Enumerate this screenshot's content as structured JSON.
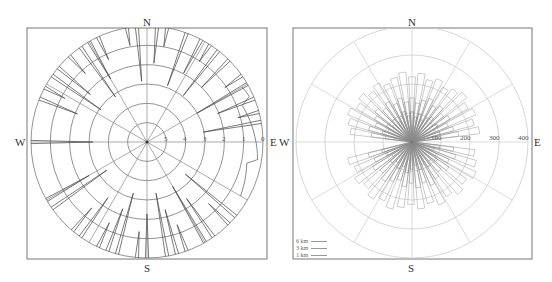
{
  "chart_data": [
    {
      "type": "polar-line",
      "title": "",
      "compass": {
        "north": "N",
        "south": "S",
        "east": "E",
        "west": "W"
      },
      "radial_tick_labels": [
        "5",
        "4",
        "3",
        "2",
        "1",
        "0"
      ],
      "rings": 6,
      "spoke_angle_step_deg": 30,
      "frame": {
        "x": 27,
        "y": 28,
        "w": 240,
        "h": 231
      },
      "center": [
        147,
        142
      ],
      "outer_radius": 116,
      "series": [
        {
          "name": "profile",
          "color": "#444444",
          "spikes_deg": [
            350,
            355,
            5,
            10,
            20,
            28,
            33,
            38,
            45,
            55,
            60,
            68,
            75,
            80,
            292,
            298,
            305,
            310,
            318,
            325,
            330,
            335,
            270,
            180,
            185,
            195,
            200,
            205,
            170,
            165,
            160,
            150,
            145,
            135,
            130,
            215,
            220,
            235,
            240
          ]
        }
      ]
    },
    {
      "type": "polar-rose",
      "title": "",
      "compass": {
        "north": "N",
        "south": "S",
        "east": "E",
        "west": "W"
      },
      "radial_tick_labels": [
        "100",
        "200",
        "300",
        "400"
      ],
      "rings": 4,
      "spoke_angle_step_deg": 30,
      "frame": {
        "x": 293,
        "y": 28,
        "w": 239,
        "h": 231
      },
      "center": [
        412,
        142
      ],
      "outer_radius": 116,
      "legend": [
        {
          "label": "6 km"
        },
        {
          "label": "3 km"
        },
        {
          "label": "1 km"
        }
      ],
      "series": [
        {
          "name": "6 km",
          "color": "#aaaaaa",
          "radius_value": 230
        },
        {
          "name": "3 km",
          "color": "#999999",
          "radius_value": 150
        },
        {
          "name": "1 km",
          "color": "#888888",
          "radius_value": 95
        }
      ]
    }
  ],
  "left": {
    "n": "N",
    "s": "S",
    "e": "E",
    "w": "W",
    "ticks": [
      "5",
      "4",
      "3",
      "2",
      "1",
      "0"
    ]
  },
  "right": {
    "n": "N",
    "s": "S",
    "e": "E",
    "w": "W",
    "ticks": [
      "100",
      "200",
      "300",
      "400"
    ],
    "legend": [
      "6 km",
      "3 km",
      "1 km"
    ]
  }
}
